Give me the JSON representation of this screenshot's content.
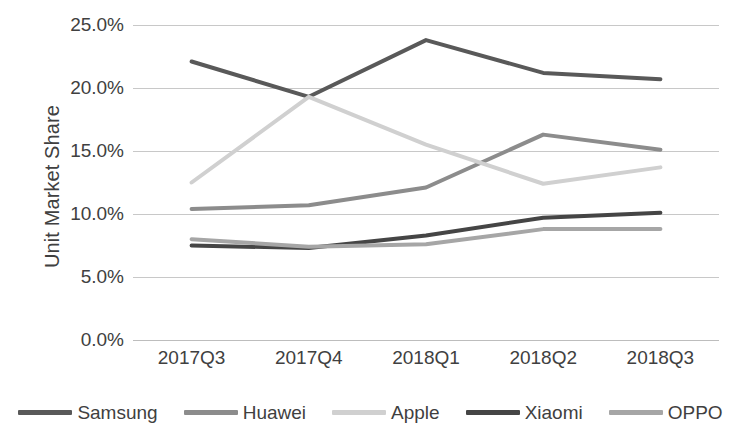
{
  "chart_data": {
    "type": "line",
    "title": "",
    "xlabel": "",
    "ylabel": "Unit Market Share",
    "categories": [
      "2017Q3",
      "2017Q4",
      "2018Q1",
      "2018Q2",
      "2018Q3"
    ],
    "ylim": [
      0,
      25
    ],
    "ytick_labels": [
      "0.0%",
      "5.0%",
      "10.0%",
      "15.0%",
      "20.0%",
      "25.0%"
    ],
    "ytick_values": [
      0,
      5,
      10,
      15,
      20,
      25
    ],
    "grid": true,
    "legend_position": "bottom",
    "value_suffix": "%",
    "series": [
      {
        "name": "Samsung",
        "color": "#595959",
        "width": 4,
        "values": [
          22.1,
          19.3,
          23.8,
          21.2,
          20.7
        ]
      },
      {
        "name": "Huawei",
        "color": "#8c8c8c",
        "width": 4,
        "values": [
          10.4,
          10.7,
          12.1,
          16.3,
          15.1
        ]
      },
      {
        "name": "Apple",
        "color": "#d0d0d0",
        "width": 4,
        "values": [
          12.5,
          19.3,
          15.5,
          12.4,
          13.7
        ]
      },
      {
        "name": "Xiaomi",
        "color": "#454545",
        "width": 4,
        "values": [
          7.5,
          7.3,
          8.3,
          9.7,
          10.1
        ]
      },
      {
        "name": "OPPO",
        "color": "#a6a6a6",
        "width": 4,
        "values": [
          8.0,
          7.4,
          7.6,
          8.8,
          8.8
        ]
      }
    ]
  }
}
